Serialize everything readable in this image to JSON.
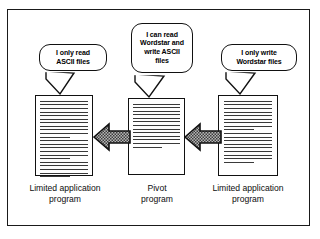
{
  "figure": {
    "background_color": "#ffffff",
    "frame_color": "#1a1a1a",
    "ink_color": "#111111",
    "arrow_fill": "#8c8c8c"
  },
  "balloons": [
    {
      "id": "left-balloon",
      "text": "I only read ASCII files",
      "line1": "I only read",
      "line2": "ASCII files",
      "points_to": "left-document"
    },
    {
      "id": "center-balloon",
      "text": "I can read Wordstar and write ASCII files",
      "line1": "I can read",
      "line2": "Wordstar and",
      "line3": "write ASCII",
      "line4": "files",
      "points_to": "center-document"
    },
    {
      "id": "right-balloon",
      "text": "I only write Wordstar files",
      "line1": "I only write",
      "line2": "Wordstar files",
      "points_to": "right-document"
    }
  ],
  "documents": [
    {
      "id": "left-document",
      "caption_line1": "Limited application",
      "caption_line2": "program",
      "line_count": 22
    },
    {
      "id": "center-document",
      "caption_line1": "Pivot",
      "caption_line2": "program",
      "line_count": 13
    },
    {
      "id": "right-document",
      "caption_line1": "Limited application",
      "caption_line2": "program",
      "line_count": 18
    }
  ],
  "arrows": [
    {
      "id": "arrow-center-to-left",
      "direction": "left",
      "from": "center-document",
      "to": "left-document"
    },
    {
      "id": "arrow-right-to-center",
      "direction": "left",
      "from": "right-document",
      "to": "center-document"
    }
  ]
}
